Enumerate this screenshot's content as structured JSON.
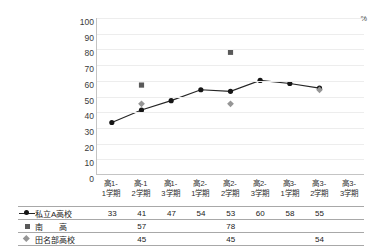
{
  "clipped_header_text": "・・・・・・・・・・・ ・・・・ ・・・・・・・",
  "colors": {
    "series_a_line": "#262626",
    "series_a_marker": "#161616",
    "series_b_marker": "#595959",
    "series_c_marker": "#969696",
    "gridline": "#ededed",
    "axis": "#c4c4c4",
    "table_rule": "#a8a8a8"
  },
  "chart_data": {
    "type": "line",
    "title": "",
    "xlabel": "",
    "ylabel": "%",
    "ylim": [
      0,
      100
    ],
    "ytick_step": 10,
    "yticks": [
      "100",
      "90",
      "80",
      "70",
      "60",
      "50",
      "40",
      "30",
      "20",
      "10",
      "0"
    ],
    "y_unit": "%",
    "grid": true,
    "legend_position": "bottom-table",
    "categories": [
      "高1-\n1学期",
      "高-1\n2学期",
      "高1-\n3学期",
      "高2-\n1学期",
      "高2-\n2学期",
      "高2-\n3学期",
      "高3-\n1学期",
      "高3-\n2学期",
      "高3-\n3学期"
    ],
    "categories_line1": [
      "高1-",
      "高-1",
      "高1-",
      "高2-",
      "高2-",
      "高2-",
      "高3-",
      "高3-",
      "高3-"
    ],
    "categories_line2": [
      "1学期",
      "2学期",
      "3学期",
      "1学期",
      "2学期",
      "3学期",
      "1学期",
      "2学期",
      "3学期"
    ],
    "series": [
      {
        "name": "私立A高校",
        "marker": "circle",
        "line": true,
        "values": [
          33,
          41,
          47,
          54,
          53,
          60,
          58,
          55,
          null
        ]
      },
      {
        "name": "南　　高",
        "marker": "square",
        "line": false,
        "values": [
          null,
          57,
          null,
          null,
          78,
          null,
          null,
          null,
          null
        ]
      },
      {
        "name": "田名部高校",
        "marker": "diamond",
        "line": false,
        "values": [
          null,
          45,
          null,
          null,
          45,
          null,
          null,
          54,
          null
        ]
      }
    ]
  },
  "table": {
    "rows": [
      {
        "label": "私立A高校",
        "marker": "circle-line",
        "values": [
          "33",
          "41",
          "47",
          "54",
          "53",
          "60",
          "58",
          "55",
          ""
        ]
      },
      {
        "label": "南　　高",
        "marker": "square",
        "values": [
          "",
          "57",
          "",
          "",
          "78",
          "",
          "",
          "",
          ""
        ]
      },
      {
        "label": "田名部高校",
        "marker": "diamond",
        "values": [
          "",
          "45",
          "",
          "",
          "45",
          "",
          "",
          "54",
          ""
        ]
      }
    ]
  }
}
